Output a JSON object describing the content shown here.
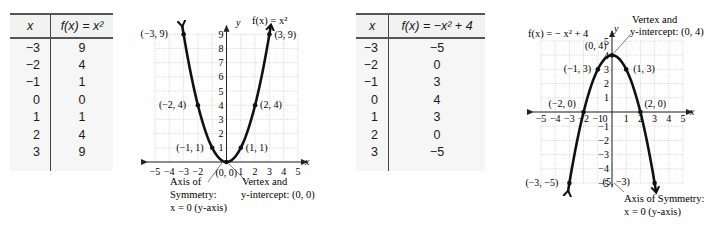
{
  "table1": {
    "headers": {
      "x": "x",
      "f": "f(x) = x²"
    },
    "rows": [
      {
        "x": "−3",
        "f": "9"
      },
      {
        "x": "−2",
        "f": "4"
      },
      {
        "x": "−1",
        "f": "1"
      },
      {
        "x": "0",
        "f": "0"
      },
      {
        "x": "1",
        "f": "1"
      },
      {
        "x": "2",
        "f": "4"
      },
      {
        "x": "3",
        "f": "9"
      }
    ]
  },
  "table2": {
    "headers": {
      "x": "x",
      "f": "f(x) = −x² + 4"
    },
    "rows": [
      {
        "x": "−3",
        "f": "−5"
      },
      {
        "x": "−2",
        "f": "0"
      },
      {
        "x": "−1",
        "f": "3"
      },
      {
        "x": "0",
        "f": "4"
      },
      {
        "x": "1",
        "f": "3"
      },
      {
        "x": "2",
        "f": "0"
      },
      {
        "x": "3",
        "f": "−5"
      }
    ]
  },
  "graph1": {
    "function_label": "f(x) = x²",
    "axis_x": "x",
    "axis_y": "y",
    "annotations": {
      "axis_of_symmetry": [
        "Axis of",
        "Symmetry:",
        "x = 0 (y-axis)"
      ],
      "vertex": [
        "Vertex and",
        "y-intercept: (0, 0)"
      ]
    }
  },
  "graph2": {
    "function_label": "f(x) = − x² + 4",
    "axis_x": "x",
    "axis_y": "y",
    "annotations": {
      "vertex": [
        "Vertex and",
        "y-intercept: (0, 4)"
      ],
      "axis_of_symmetry": [
        "Axis of Symmetry:",
        "x = 0 (y-axis)"
      ]
    }
  },
  "chart_data": [
    {
      "type": "line",
      "title": "f(x) = x²",
      "xlabel": "x",
      "ylabel": "y",
      "xlim": [
        -5,
        5
      ],
      "ylim": [
        0,
        9
      ],
      "grid": true,
      "x_ticks": [
        -5,
        -4,
        -3,
        -2,
        1,
        2,
        3,
        4,
        5
      ],
      "y_ticks": [
        1,
        2,
        3,
        4,
        5,
        6,
        7,
        8,
        9
      ],
      "points": [
        {
          "x": -3,
          "y": 9,
          "label": "(−3, 9)"
        },
        {
          "x": -2,
          "y": 4,
          "label": "(−2, 4)"
        },
        {
          "x": -1,
          "y": 1,
          "label": "(−1, 1)"
        },
        {
          "x": 0,
          "y": 0,
          "label": "(0, 0)"
        },
        {
          "x": 1,
          "y": 1,
          "label": "(1, 1)"
        },
        {
          "x": 2,
          "y": 4,
          "label": "(2, 4)"
        },
        {
          "x": 3,
          "y": 9,
          "label": "(3, 9)"
        }
      ],
      "curve": {
        "a": 1,
        "c": 0,
        "x_range": [
          -3.1,
          3.1
        ]
      },
      "annotations": [
        "Axis of Symmetry: x = 0 (y-axis)",
        "Vertex and y-intercept: (0, 0)"
      ]
    },
    {
      "type": "line",
      "title": "f(x) = −x² + 4",
      "xlabel": "x",
      "ylabel": "y",
      "xlim": [
        -5,
        5
      ],
      "ylim": [
        -5,
        5
      ],
      "grid": true,
      "x_ticks": [
        -5,
        -4,
        -3,
        -2,
        -1,
        0,
        1,
        2,
        3,
        4,
        5
      ],
      "y_ticks": [
        -5,
        -4,
        -3,
        -2,
        -1,
        1,
        2,
        3,
        4,
        5
      ],
      "points": [
        {
          "x": -3,
          "y": -5,
          "label": "(−3, −5)"
        },
        {
          "x": -2,
          "y": 0,
          "label": "(−2, 0)"
        },
        {
          "x": -1,
          "y": 3,
          "label": "(−1, 3)"
        },
        {
          "x": 0,
          "y": 4,
          "label": "(0, 4)"
        },
        {
          "x": 1,
          "y": 3,
          "label": "(1, 3)"
        },
        {
          "x": 2,
          "y": 0,
          "label": "(2, 0)"
        },
        {
          "x": 3,
          "y": -5,
          "label": "(5, −3)"
        }
      ],
      "curve": {
        "a": -1,
        "c": 4,
        "x_range": [
          -3.1,
          3.1
        ]
      },
      "annotations": [
        "Vertex and y-intercept: (0, 4)",
        "Axis of Symmetry: x = 0 (y-axis)"
      ]
    }
  ]
}
